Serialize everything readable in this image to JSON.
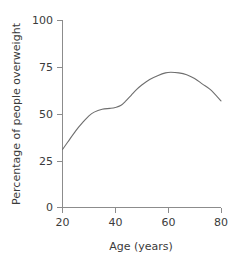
{
  "chart_data": {
    "type": "line",
    "title": "",
    "xlabel": "Age (years)",
    "ylabel": "Percentage of people overweight",
    "xlim": [
      20,
      80
    ],
    "ylim": [
      0,
      100
    ],
    "xticks": [
      20,
      40,
      60,
      80
    ],
    "yticks": [
      0,
      25,
      50,
      75,
      100
    ],
    "xtick_labels": [
      "20",
      "40",
      "60",
      "80"
    ],
    "ytick_labels": [
      "0",
      "25",
      "50",
      "75",
      "100"
    ],
    "grid": false,
    "legend": "none",
    "series": [
      {
        "name": "Percentage of people overweight",
        "color": "#6e6e6e",
        "x": [
          20,
          22,
          25,
          28,
          30,
          32,
          35,
          38,
          40,
          42,
          44,
          46,
          48,
          50,
          53,
          56,
          59,
          61,
          64,
          67,
          70,
          73,
          76,
          80
        ],
        "values": [
          31,
          35,
          41,
          46,
          49,
          51,
          52.5,
          53,
          53.5,
          54.5,
          57,
          60,
          63,
          65.5,
          68.5,
          70.5,
          72,
          72.3,
          72,
          71,
          69,
          66,
          63,
          57
        ]
      }
    ],
    "annotations": []
  },
  "axes": {
    "y_axis_label": "Percentage of people overweight",
    "x_axis_label": "Age (years)",
    "y_tick_0": "0",
    "y_tick_1": "25",
    "y_tick_2": "50",
    "y_tick_3": "75",
    "y_tick_4": "100",
    "x_tick_0": "20",
    "x_tick_1": "40",
    "x_tick_2": "60",
    "x_tick_3": "80"
  },
  "colors": {
    "curve": "#6e6e6e",
    "axis": "#8c8c8c",
    "text": "#3b3b3b",
    "background": "#ffffff"
  }
}
